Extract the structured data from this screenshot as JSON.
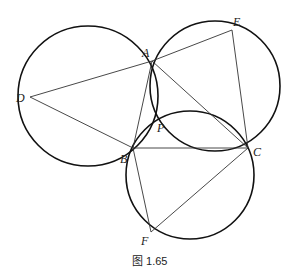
{
  "caption": "图 1.65",
  "points": {
    "A": {
      "label": "A",
      "x": 152,
      "y": 61,
      "lx": 142,
      "ly": 57
    },
    "B": {
      "label": "B",
      "x": 133,
      "y": 148,
      "lx": 120,
      "ly": 163
    },
    "C": {
      "label": "C",
      "x": 248,
      "y": 148,
      "lx": 253,
      "ly": 156
    },
    "D": {
      "label": "D",
      "x": 30,
      "y": 97,
      "lx": 16,
      "ly": 102
    },
    "E": {
      "label": "E",
      "x": 232,
      "y": 30,
      "lx": 233,
      "ly": 26
    },
    "F": {
      "label": "F",
      "x": 151,
      "y": 232,
      "lx": 141,
      "ly": 245
    },
    "P": {
      "label": "P",
      "x": 152,
      "y": 125,
      "lx": 157,
      "ly": 132
    }
  },
  "circles": [
    {
      "name": "circle-ABD",
      "cx": 88,
      "cy": 96,
      "r": 70
    },
    {
      "name": "circle-AEC",
      "cx": 215,
      "cy": 86,
      "r": 65
    },
    {
      "name": "circle-BCF",
      "cx": 190,
      "cy": 175,
      "r": 64
    }
  ],
  "segments": [
    [
      "D",
      "A"
    ],
    [
      "D",
      "B"
    ],
    [
      "A",
      "E"
    ],
    [
      "E",
      "C"
    ],
    [
      "A",
      "C"
    ],
    [
      "B",
      "C"
    ],
    [
      "A",
      "B"
    ],
    [
      "B",
      "F"
    ],
    [
      "F",
      "C"
    ]
  ]
}
